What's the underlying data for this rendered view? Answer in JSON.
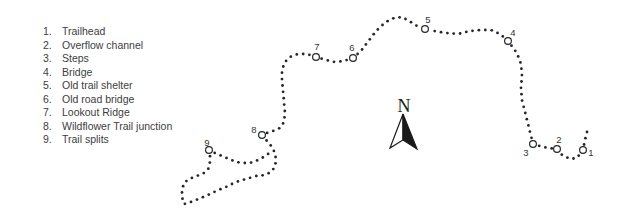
{
  "legend": {
    "items": [
      {
        "num": "1.",
        "label": "Trailhead"
      },
      {
        "num": "2.",
        "label": "Overflow channel"
      },
      {
        "num": "3.",
        "label": "Steps"
      },
      {
        "num": "4.",
        "label": "Bridge"
      },
      {
        "num": "5.",
        "label": "Old trail shelter"
      },
      {
        "num": "6.",
        "label": "Old road bridge"
      },
      {
        "num": "7.",
        "label": "Lookout Ridge"
      },
      {
        "num": "8.",
        "label": "Wildflower Trail junction"
      },
      {
        "num": "9.",
        "label": "Trail splits"
      }
    ]
  },
  "compass": {
    "label": "N"
  },
  "map": {
    "colors": {
      "dot": "#262626",
      "marker_stroke": "#262626",
      "marker_fill": "#ffffff",
      "label_text": "#333333"
    },
    "dot_spacing": 6.4,
    "dot_radius": 1.4,
    "marker_radius": 3.4,
    "marker_stroke_width": 1.2,
    "markers": [
      {
        "id": "1",
        "cx": 583,
        "cy": 150,
        "lx": 591,
        "ly": 156
      },
      {
        "id": "2",
        "cx": 557,
        "cy": 149,
        "lx": 559,
        "ly": 143
      },
      {
        "id": "3",
        "cx": 533,
        "cy": 144,
        "lx": 526,
        "ly": 156
      },
      {
        "id": "4",
        "cx": 508,
        "cy": 41,
        "lx": 513,
        "ly": 36
      },
      {
        "id": "5",
        "cx": 425,
        "cy": 29,
        "lx": 428,
        "ly": 23
      },
      {
        "id": "6",
        "cx": 353,
        "cy": 58,
        "lx": 352,
        "ly": 51
      },
      {
        "id": "7",
        "cx": 316,
        "cy": 57,
        "lx": 317,
        "ly": 50
      },
      {
        "id": "8",
        "cx": 262,
        "cy": 135,
        "lx": 254,
        "ly": 133
      },
      {
        "id": "9",
        "cx": 209,
        "cy": 150,
        "lx": 207,
        "ly": 146
      }
    ],
    "paths": [
      {
        "name": "main-trail",
        "points": [
          [
            587,
            132
          ],
          [
            585,
            140
          ],
          [
            583,
            150
          ],
          [
            577,
            158
          ],
          [
            570,
            159
          ],
          [
            562,
            155
          ],
          [
            557,
            149
          ],
          [
            548,
            148
          ],
          [
            540,
            146
          ],
          [
            533,
            144
          ],
          [
            531,
            136
          ],
          [
            528,
            124
          ],
          [
            525,
            112
          ],
          [
            522,
            100
          ],
          [
            521,
            88
          ],
          [
            522,
            76
          ],
          [
            521,
            64
          ],
          [
            517,
            53
          ],
          [
            508,
            41
          ],
          [
            500,
            34
          ],
          [
            491,
            30
          ],
          [
            481,
            30
          ],
          [
            470,
            31
          ],
          [
            458,
            34
          ],
          [
            446,
            33
          ],
          [
            434,
            31
          ],
          [
            425,
            29
          ],
          [
            417,
            26
          ],
          [
            409,
            21
          ],
          [
            402,
            17
          ],
          [
            394,
            18
          ],
          [
            386,
            22
          ],
          [
            379,
            28
          ],
          [
            373,
            35
          ],
          [
            367,
            43
          ],
          [
            361,
            51
          ],
          [
            353,
            58
          ],
          [
            344,
            61
          ],
          [
            335,
            62
          ],
          [
            326,
            60
          ],
          [
            316,
            57
          ],
          [
            307,
            54
          ],
          [
            298,
            54
          ],
          [
            290,
            57
          ],
          [
            285,
            62
          ],
          [
            282,
            70
          ],
          [
            282,
            80
          ],
          [
            283,
            91
          ],
          [
            284,
            102
          ],
          [
            285,
            113
          ],
          [
            284,
            122
          ],
          [
            280,
            128
          ],
          [
            273,
            131
          ],
          [
            267,
            133
          ],
          [
            262,
            135
          ],
          [
            267,
            141
          ],
          [
            272,
            147
          ],
          [
            275,
            153
          ],
          [
            276,
            160
          ],
          [
            275,
            167
          ],
          [
            271,
            172
          ],
          [
            265,
            175
          ],
          [
            256,
            176
          ],
          [
            246,
            179
          ],
          [
            236,
            182
          ],
          [
            226,
            187
          ],
          [
            216,
            191
          ],
          [
            206,
            196
          ],
          [
            196,
            200
          ],
          [
            188,
            203
          ],
          [
            184,
            204
          ],
          [
            182,
            197
          ],
          [
            182,
            190
          ],
          [
            184,
            183
          ],
          [
            189,
            179
          ],
          [
            197,
            176
          ],
          [
            204,
            173
          ],
          [
            209,
            168
          ],
          [
            210,
            161
          ],
          [
            210,
            155
          ],
          [
            209,
            150
          ]
        ]
      },
      {
        "name": "split-branch",
        "points": [
          [
            209,
            150
          ],
          [
            215,
            153
          ],
          [
            222,
            156
          ],
          [
            229,
            159
          ],
          [
            236,
            162
          ],
          [
            243,
            163
          ],
          [
            250,
            163
          ],
          [
            256,
            161
          ],
          [
            262,
            158
          ],
          [
            268,
            154
          ],
          [
            272,
            150
          ]
        ]
      }
    ]
  }
}
